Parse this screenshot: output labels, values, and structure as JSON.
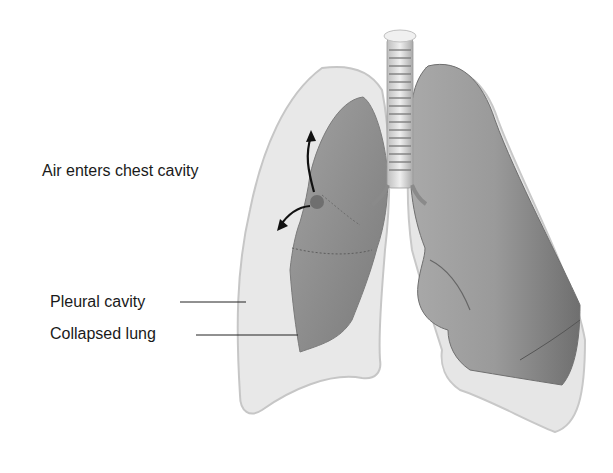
{
  "figure": {
    "labels": {
      "air_enters": "Air enters chest cavity",
      "pleural_cavity": "Pleural cavity",
      "collapsed_lung": "Collapsed lung"
    },
    "colors": {
      "pleural_fill": "#e6e6e6",
      "pleural_edge": "#c4c4c4",
      "lung_fill": "#8f8f8f",
      "lung_dark": "#6e6e6e",
      "trachea": "#d8d8d8",
      "leader_line": "#222222"
    }
  }
}
